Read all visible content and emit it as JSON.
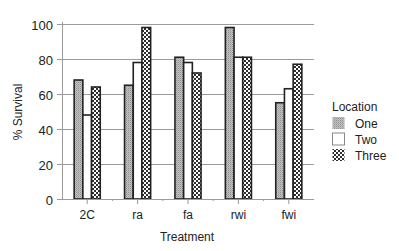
{
  "chart_data": {
    "type": "bar",
    "title": "",
    "xlabel": "Treatment",
    "ylabel": "% Survival",
    "categories": [
      "2C",
      "ra",
      "fa",
      "rwi",
      "fwi"
    ],
    "series": [
      {
        "name": "One",
        "values": [
          68,
          65,
          81,
          98,
          55
        ],
        "fill": "stipple-gray"
      },
      {
        "name": "Two",
        "values": [
          48,
          78,
          78,
          81,
          63
        ],
        "fill": "white"
      },
      {
        "name": "Three",
        "values": [
          64,
          98,
          72,
          81,
          77
        ],
        "fill": "checker"
      }
    ],
    "ylim": [
      0,
      100
    ],
    "yticks": [
      0,
      20,
      40,
      60,
      80,
      100
    ],
    "grid": true,
    "legend": {
      "title": "Location",
      "position": "right"
    }
  },
  "colors": {
    "one_fill": "#b5b5b5",
    "two_fill": "#ffffff",
    "three_dark": "#333333",
    "three_light": "#ffffff",
    "outline": "#222222",
    "grid": "#9a9a9a"
  }
}
